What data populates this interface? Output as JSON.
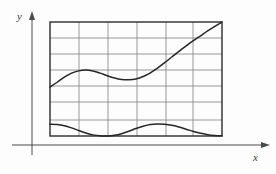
{
  "figure": {
    "axes": {
      "y_label": "y",
      "x_label": "x",
      "origin": {
        "x": 32,
        "y": 145
      },
      "x_axis_end": {
        "x": 268,
        "y": 145
      },
      "y_axis_end": {
        "x": 32,
        "y": 13
      }
    },
    "grid": {
      "left": 50,
      "right": 222,
      "top": 22,
      "bottom": 136,
      "columns": 6,
      "rows": 7,
      "vertical_line_x": [
        50,
        79,
        108,
        137,
        166,
        193,
        222
      ],
      "horizontal_line_y": [
        22,
        38,
        54,
        70,
        86,
        102,
        120,
        136
      ],
      "border_color": "#2b2b2b",
      "line_color": "#8d8d8d"
    },
    "colors": {
      "background": "#fdfdfd",
      "axis": "#4a4a4a",
      "curve": "#262626",
      "grid_interior": "#8d8d8d",
      "grid_border": "#2b2b2b"
    }
  },
  "chart_data": {
    "type": "line",
    "title": "",
    "xlabel": "x",
    "ylabel": "y",
    "grid": true,
    "legend": null,
    "xlim": [
      0,
      6
    ],
    "ylim": [
      0,
      7
    ],
    "series": [
      {
        "name": "rising-wavy-curve",
        "description": "Monotone-ish increasing curve with a sinusoidal ripple; starts at left edge mid-height, dips in the middle, then rises linearly to the top-right corner of the grid.",
        "x": [
          0.0,
          0.25,
          0.5,
          0.75,
          1.0,
          1.25,
          1.5,
          1.75,
          2.0,
          2.25,
          2.5,
          2.75,
          3.0,
          3.25,
          3.5,
          3.75,
          4.0,
          4.25,
          4.5,
          4.75,
          5.0,
          5.25,
          5.5,
          5.75,
          6.0
        ],
        "y": [
          3.0,
          3.3,
          3.62,
          3.86,
          4.0,
          4.05,
          3.99,
          3.86,
          3.7,
          3.56,
          3.47,
          3.45,
          3.5,
          3.65,
          3.88,
          4.17,
          4.5,
          4.85,
          5.2,
          5.53,
          5.85,
          6.15,
          6.45,
          6.73,
          7.0
        ]
      },
      {
        "name": "bottom-wave",
        "description": "Low-amplitude wave near the bottom of the grid, with two crests and two troughs touching the lower border.",
        "x": [
          0.0,
          0.25,
          0.5,
          0.75,
          1.0,
          1.25,
          1.5,
          1.75,
          2.0,
          2.25,
          2.5,
          2.75,
          3.0,
          3.25,
          3.5,
          3.75,
          4.0,
          4.25,
          4.5,
          4.75,
          5.0,
          5.25,
          5.5,
          5.75,
          6.0
        ],
        "y": [
          0.72,
          0.7,
          0.63,
          0.5,
          0.34,
          0.19,
          0.07,
          0.01,
          0.0,
          0.04,
          0.14,
          0.29,
          0.46,
          0.6,
          0.7,
          0.74,
          0.72,
          0.66,
          0.55,
          0.42,
          0.28,
          0.17,
          0.08,
          0.03,
          0.01
        ]
      }
    ]
  }
}
